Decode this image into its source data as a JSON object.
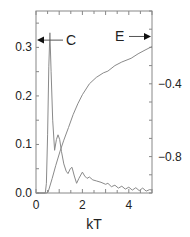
{
  "chart_data": {
    "type": "line",
    "title": "",
    "xlabel": "kT",
    "ylabel_left": "",
    "ylabel_right": "",
    "xlim": [
      0,
      5
    ],
    "ylim_left": [
      0.0,
      0.375
    ],
    "ylim_right": [
      -1.0,
      0.0
    ],
    "x_ticks": [
      0,
      2,
      4
    ],
    "x_tick_labels": [
      "0",
      "2",
      "4"
    ],
    "y_left_ticks": [
      0.0,
      0.1,
      0.2,
      0.3
    ],
    "y_left_tick_labels": [
      "0.0",
      "0.1",
      "0.2",
      "0.3"
    ],
    "y_right_ticks": [
      -0.4,
      -0.8
    ],
    "y_right_tick_labels": [
      "−0.4",
      "−0.8"
    ],
    "grid": false,
    "annotations": [
      {
        "text": "C",
        "arrow": "left",
        "points_to": "left-axis",
        "y_left": 0.315
      },
      {
        "text": "E",
        "arrow": "right",
        "points_to": "right-axis",
        "y_right": -0.14
      }
    ],
    "series": [
      {
        "name": "C",
        "axis": "left",
        "x": [
          0.0,
          0.4,
          0.45,
          0.5,
          0.55,
          0.6,
          0.65,
          0.72,
          0.8,
          0.88,
          0.95,
          1.02,
          1.1,
          1.2,
          1.3,
          1.38,
          1.48,
          1.55,
          1.65,
          1.75,
          1.85,
          2.0,
          2.1,
          2.2,
          2.3,
          2.45,
          2.6,
          2.8,
          3.0,
          3.1,
          3.25,
          3.4,
          3.55,
          3.7,
          3.85,
          4.0,
          4.15,
          4.3,
          4.45,
          4.6,
          4.75,
          4.9,
          5.0
        ],
        "values": [
          0.0,
          0.0,
          0.02,
          0.12,
          0.26,
          0.33,
          0.25,
          0.15,
          0.088,
          0.11,
          0.12,
          0.11,
          0.085,
          0.06,
          0.045,
          0.04,
          0.05,
          0.053,
          0.035,
          0.02,
          0.03,
          0.043,
          0.035,
          0.03,
          0.033,
          0.027,
          0.025,
          0.022,
          0.018,
          0.02,
          0.013,
          0.016,
          0.01,
          0.014,
          0.008,
          0.012,
          0.006,
          0.011,
          0.005,
          0.01,
          0.004,
          0.007,
          0.006
        ]
      },
      {
        "name": "E",
        "axis": "right",
        "x": [
          0.0,
          0.45,
          0.52,
          0.7,
          0.85,
          1.04,
          1.2,
          1.4,
          1.6,
          1.8,
          2.0,
          2.3,
          2.6,
          2.9,
          3.1,
          3.4,
          3.7,
          4.1,
          4.4,
          4.7,
          5.0
        ],
        "values": [
          -1.0,
          -1.0,
          -0.995,
          -0.92,
          -0.85,
          -0.77,
          -0.71,
          -0.64,
          -0.57,
          -0.51,
          -0.46,
          -0.4,
          -0.365,
          -0.34,
          -0.33,
          -0.3,
          -0.28,
          -0.26,
          -0.235,
          -0.215,
          -0.195
        ]
      }
    ]
  }
}
